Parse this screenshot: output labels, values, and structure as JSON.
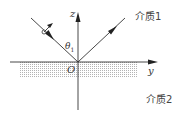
{
  "diagram": {
    "axes": {
      "z_label": "z",
      "y_label": "y",
      "origin_label": "O"
    },
    "angle": {
      "symbol": "θ",
      "subscript": "1"
    },
    "media": {
      "upper": "介质1",
      "lower": "介质2"
    },
    "colors": {
      "line": "#333333",
      "shade": "#cfcfcf",
      "background": "#ffffff"
    }
  }
}
